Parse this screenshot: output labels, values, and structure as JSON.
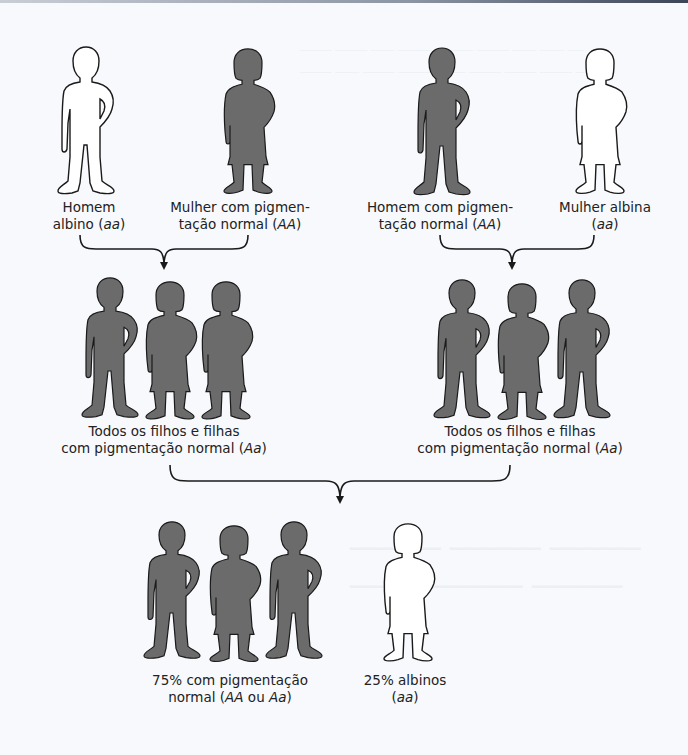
{
  "figure": {
    "title": "",
    "colors": {
      "pigmented": "#6b6b6b",
      "albino": "#ffffff",
      "outline": "#1a1a1a",
      "background": "#f7f9fc"
    },
    "parents_left": {
      "male": {
        "label_line1": "Homem",
        "label_line2_pre": "albino (",
        "genotype": "aa",
        "label_line2_post": ")",
        "phenotype": "albino"
      },
      "female": {
        "label_line1": "Mulher com pigmen-",
        "label_line2_pre": "tação normal (",
        "genotype": "AA",
        "label_line2_post": ")",
        "phenotype": "pigmented"
      }
    },
    "parents_right": {
      "male": {
        "label_line1": "Homem com pigmen-",
        "label_line2_pre": "tação normal (",
        "genotype": "AA",
        "label_line2_post": ")",
        "phenotype": "pigmented"
      },
      "female": {
        "label_line1": "Mulher albina",
        "label_line2_pre": "(",
        "genotype": "aa",
        "label_line2_post": ")",
        "phenotype": "albino"
      }
    },
    "f1_left": {
      "label_line1": "Todos os filhos e filhas",
      "label_line2_pre": "com pigmentação normal (",
      "genotype": "Aa",
      "label_line2_post": ")",
      "children": [
        "male",
        "female",
        "female"
      ]
    },
    "f1_right": {
      "label_line1": "Todos os filhos e filhas",
      "label_line2_pre": "com pigmentação normal (",
      "genotype": "Aa",
      "label_line2_post": ")",
      "children": [
        "male",
        "female",
        "male"
      ]
    },
    "f2_pigmented": {
      "label_line1": "75% com pigmentação",
      "label_line2_pre": "normal (",
      "genotype_1": "AA",
      "joiner": " ou ",
      "genotype_2": "Aa",
      "label_line2_post": ")",
      "percent": "75%",
      "children": [
        "male",
        "female",
        "male"
      ]
    },
    "f2_albino": {
      "label_line1": "25% albinos",
      "label_line2_pre": "(",
      "genotype": "aa",
      "label_line2_post": ")",
      "percent": "25%",
      "children": [
        "female"
      ]
    }
  }
}
